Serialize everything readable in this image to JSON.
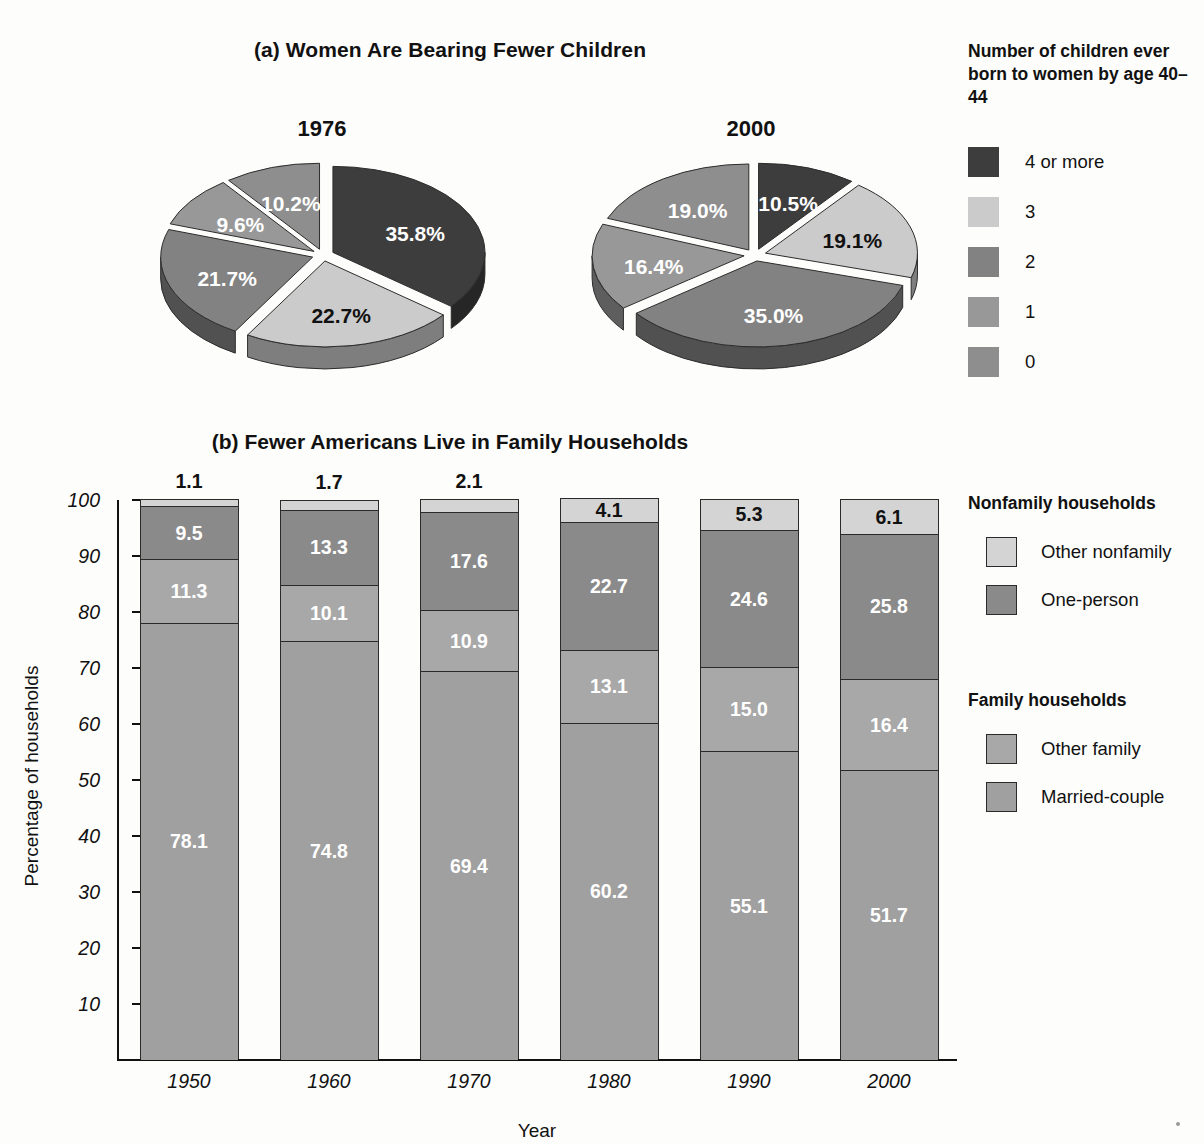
{
  "figure": {
    "panel_a_title": "(a) Women Are Bearing Fewer Children",
    "panel_b_title": "(b) Fewer Americans Live in Family Households"
  },
  "legend_a": {
    "title": "Number of children ever born to women by age 40–44",
    "items": [
      {
        "label": "4 or more",
        "color": "#3d3d3d"
      },
      {
        "label": "3",
        "color": "#cbcbcb"
      },
      {
        "label": "2",
        "color": "#828282"
      },
      {
        "label": "1",
        "color": "#989898"
      },
      {
        "label": "0",
        "color": "#8e8e8e"
      }
    ]
  },
  "legend_b": {
    "group1_title": "Nonfamily households",
    "group2_title": "Family households",
    "items": [
      {
        "label": "Other nonfamily",
        "color": "#d4d4d4"
      },
      {
        "label": "One-person",
        "color": "#8a8a8a"
      },
      {
        "label": "Other family",
        "color": "#a8a8a8"
      },
      {
        "label": "Married-couple",
        "color": "#a0a0a0"
      }
    ]
  },
  "chart_data": [
    {
      "type": "pie",
      "title": "1976",
      "legend_title": "Number of children ever born to women by age 40–44",
      "categories": [
        "4 or more",
        "3",
        "2",
        "1",
        "0"
      ],
      "values": [
        35.8,
        22.7,
        21.7,
        9.6,
        10.2
      ],
      "labels": [
        "35.8%",
        "22.7%",
        "21.7%",
        "9.6%",
        "10.2%"
      ],
      "colors": [
        "#3d3d3d",
        "#cbcbcb",
        "#828282",
        "#989898",
        "#8e8e8e"
      ],
      "label_colors": [
        "white",
        "black",
        "white",
        "white",
        "white"
      ],
      "exploded": true
    },
    {
      "type": "pie",
      "title": "2000",
      "legend_title": "Number of children ever born to women by age 40–44",
      "categories": [
        "4 or more",
        "3",
        "2",
        "1",
        "0"
      ],
      "values": [
        10.5,
        19.1,
        35.0,
        16.4,
        19.0
      ],
      "labels": [
        "10.5%",
        "19.1%",
        "35.0%",
        "16.4%",
        "19.0%"
      ],
      "colors": [
        "#3d3d3d",
        "#cbcbcb",
        "#828282",
        "#989898",
        "#8e8e8e"
      ],
      "label_colors": [
        "white",
        "black",
        "white",
        "white",
        "white"
      ],
      "exploded": true
    },
    {
      "type": "bar",
      "subtype": "stacked",
      "title": "(b) Fewer Americans Live in Family Households",
      "xlabel": "Year",
      "ylabel": "Percentage of households",
      "categories": [
        "1950",
        "1960",
        "1970",
        "1980",
        "1990",
        "2000"
      ],
      "ylim": [
        0,
        100
      ],
      "yticks": [
        10,
        20,
        30,
        40,
        50,
        60,
        70,
        80,
        90,
        100
      ],
      "grid": false,
      "legend_position": "right",
      "series": [
        {
          "name": "Married-couple",
          "color": "#a0a0a0",
          "label_color": "white",
          "values": [
            78.1,
            74.8,
            69.4,
            60.2,
            55.1,
            51.7
          ],
          "labels": [
            "78.1",
            "74.8",
            "69.4",
            "60.2",
            "55.1",
            "51.7"
          ]
        },
        {
          "name": "Other family",
          "color": "#a8a8a8",
          "label_color": "white",
          "values": [
            11.3,
            10.1,
            10.9,
            13.1,
            15.0,
            16.4
          ],
          "labels": [
            "11.3",
            "10.1",
            "10.9",
            "13.1",
            "15.0",
            "16.4"
          ]
        },
        {
          "name": "One-person",
          "color": "#8a8a8a",
          "label_color": "white",
          "values": [
            9.5,
            13.3,
            17.6,
            22.7,
            24.6,
            25.8
          ],
          "labels": [
            "9.5",
            "13.3",
            "17.6",
            "22.7",
            "24.6",
            "25.8"
          ]
        },
        {
          "name": "Other nonfamily",
          "color": "#d4d4d4",
          "label_color": "black",
          "values": [
            1.1,
            1.7,
            2.1,
            4.1,
            5.3,
            6.1
          ],
          "labels": [
            "1.1",
            "1.7",
            "2.1",
            "4.1",
            "5.3",
            "6.1"
          ],
          "labels_outside": [
            true,
            true,
            true,
            false,
            false,
            false
          ]
        }
      ]
    }
  ]
}
